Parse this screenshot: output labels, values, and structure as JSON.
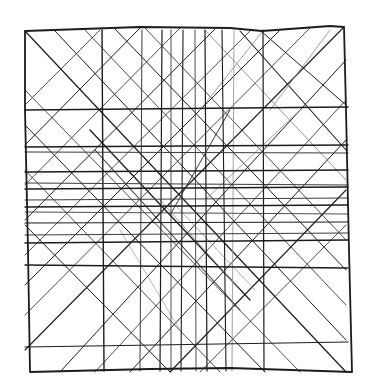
{
  "drawing": {
    "subject": "pencil sketch of a square filled with crossing horizontal, vertical and diagonal lines",
    "paper_color": "#ffffff",
    "ink_color": "#1c1c1c",
    "frame": [
      [
        25,
        31
      ],
      [
        140,
        27
      ],
      [
        230,
        28
      ],
      [
        262,
        31
      ],
      [
        330,
        26
      ],
      [
        344,
        27
      ],
      [
        346,
        110
      ],
      [
        349,
        250
      ],
      [
        352,
        372
      ],
      [
        230,
        368
      ],
      [
        150,
        369
      ],
      [
        30,
        372
      ],
      [
        28,
        250
      ],
      [
        25,
        110
      ],
      [
        25,
        31
      ]
    ],
    "horizontals": [
      {
        "y1": 110,
        "y2": 107,
        "w": 1.6,
        "tone": "dark"
      },
      {
        "y1": 147,
        "y2": 145,
        "w": 1.3,
        "tone": "dark"
      },
      {
        "y1": 152,
        "y2": 153,
        "w": 1.0,
        "tone": "mid"
      },
      {
        "y1": 172,
        "y2": 170,
        "w": 1.5,
        "tone": "dark"
      },
      {
        "y1": 183,
        "y2": 185,
        "w": 1.0,
        "tone": "mid"
      },
      {
        "y1": 189,
        "y2": 187,
        "w": 1.4,
        "tone": "dark"
      },
      {
        "y1": 200,
        "y2": 198,
        "w": 1.0,
        "tone": "mid"
      },
      {
        "y1": 207,
        "y2": 205,
        "w": 1.5,
        "tone": "dark"
      },
      {
        "y1": 212,
        "y2": 214,
        "w": 0.9,
        "tone": "mid"
      },
      {
        "y1": 223,
        "y2": 222,
        "w": 1.2,
        "tone": "dark"
      },
      {
        "y1": 235,
        "y2": 233,
        "w": 1.0,
        "tone": "mid"
      },
      {
        "y1": 243,
        "y2": 240,
        "w": 1.3,
        "tone": "dark"
      },
      {
        "y1": 265,
        "y2": 268,
        "w": 1.3,
        "tone": "dark"
      },
      {
        "y1": 347,
        "y2": 342,
        "w": 1.2,
        "tone": "dark"
      }
    ],
    "verticals": [
      {
        "x1": 102,
        "x2": 104,
        "w": 1.4,
        "tone": "dark"
      },
      {
        "x1": 142,
        "x2": 140,
        "w": 1.0,
        "tone": "mid"
      },
      {
        "x1": 162,
        "x2": 160,
        "w": 1.2,
        "tone": "dark"
      },
      {
        "x1": 171,
        "x2": 171,
        "w": 0.9,
        "tone": "mid"
      },
      {
        "x1": 183,
        "x2": 181,
        "w": 1.1,
        "tone": "dark"
      },
      {
        "x1": 195,
        "x2": 196,
        "w": 0.9,
        "tone": "mid"
      },
      {
        "x1": 205,
        "x2": 207,
        "w": 1.2,
        "tone": "dark"
      },
      {
        "x1": 222,
        "x2": 226,
        "w": 1.1,
        "tone": "dark"
      },
      {
        "x1": 234,
        "x2": 232,
        "w": 0.8,
        "tone": "light"
      },
      {
        "x1": 263,
        "x2": 264,
        "w": 1.2,
        "tone": "dark"
      }
    ],
    "diagonals": [
      {
        "x1": 25,
        "y1": 31,
        "x2": 346,
        "y2": 372,
        "w": 1.2,
        "tone": "dark"
      },
      {
        "x1": 55,
        "y1": 31,
        "x2": 346,
        "y2": 340,
        "w": 1.0,
        "tone": "dark"
      },
      {
        "x1": 85,
        "y1": 30,
        "x2": 346,
        "y2": 305,
        "w": 0.9,
        "tone": "mid"
      },
      {
        "x1": 115,
        "y1": 29,
        "x2": 346,
        "y2": 270,
        "w": 1.0,
        "tone": "dark"
      },
      {
        "x1": 145,
        "y1": 28,
        "x2": 346,
        "y2": 240,
        "w": 0.9,
        "tone": "mid"
      },
      {
        "x1": 25,
        "y1": 90,
        "x2": 300,
        "y2": 372,
        "w": 0.9,
        "tone": "mid"
      },
      {
        "x1": 25,
        "y1": 125,
        "x2": 265,
        "y2": 372,
        "w": 1.0,
        "tone": "dark"
      },
      {
        "x1": 25,
        "y1": 170,
        "x2": 220,
        "y2": 372,
        "w": 0.9,
        "tone": "mid"
      },
      {
        "x1": 25,
        "y1": 225,
        "x2": 170,
        "y2": 372,
        "w": 1.0,
        "tone": "dark"
      },
      {
        "x1": 90,
        "y1": 130,
        "x2": 250,
        "y2": 300,
        "w": 1.3,
        "tone": "dark"
      },
      {
        "x1": 95,
        "y1": 150,
        "x2": 240,
        "y2": 310,
        "w": 1.1,
        "tone": "mid"
      },
      {
        "x1": 240,
        "y1": 31,
        "x2": 346,
        "y2": 150,
        "w": 1.1,
        "tone": "dark"
      },
      {
        "x1": 205,
        "y1": 30,
        "x2": 346,
        "y2": 180,
        "w": 0.9,
        "tone": "light"
      },
      {
        "x1": 344,
        "y1": 27,
        "x2": 25,
        "y2": 350,
        "w": 1.1,
        "tone": "dark"
      },
      {
        "x1": 310,
        "y1": 28,
        "x2": 25,
        "y2": 315,
        "w": 0.9,
        "tone": "mid"
      },
      {
        "x1": 280,
        "y1": 30,
        "x2": 25,
        "y2": 285,
        "w": 1.0,
        "tone": "dark"
      },
      {
        "x1": 250,
        "y1": 31,
        "x2": 25,
        "y2": 255,
        "w": 0.9,
        "tone": "mid"
      },
      {
        "x1": 215,
        "y1": 29,
        "x2": 25,
        "y2": 220,
        "w": 1.0,
        "tone": "dark"
      },
      {
        "x1": 180,
        "y1": 28,
        "x2": 25,
        "y2": 185,
        "w": 0.9,
        "tone": "mid"
      },
      {
        "x1": 140,
        "y1": 28,
        "x2": 25,
        "y2": 145,
        "w": 1.0,
        "tone": "dark"
      },
      {
        "x1": 100,
        "y1": 30,
        "x2": 25,
        "y2": 105,
        "w": 0.9,
        "tone": "mid"
      },
      {
        "x1": 346,
        "y1": 60,
        "x2": 60,
        "y2": 372,
        "w": 1.0,
        "tone": "dark"
      },
      {
        "x1": 346,
        "y1": 100,
        "x2": 95,
        "y2": 372,
        "w": 0.9,
        "tone": "mid"
      },
      {
        "x1": 346,
        "y1": 140,
        "x2": 130,
        "y2": 372,
        "w": 1.0,
        "tone": "dark"
      },
      {
        "x1": 346,
        "y1": 190,
        "x2": 170,
        "y2": 372,
        "w": 1.1,
        "tone": "dark"
      },
      {
        "x1": 346,
        "y1": 225,
        "x2": 200,
        "y2": 372,
        "w": 0.9,
        "tone": "mid"
      },
      {
        "x1": 330,
        "y1": 30,
        "x2": 270,
        "y2": 110,
        "w": 0.8,
        "tone": "light"
      },
      {
        "x1": 300,
        "y1": 110,
        "x2": 205,
        "y2": 200,
        "w": 0.8,
        "tone": "light"
      },
      {
        "x1": 230,
        "y1": 110,
        "x2": 170,
        "y2": 215,
        "w": 1.0,
        "tone": "mid"
      },
      {
        "x1": 262,
        "y1": 32,
        "x2": 346,
        "y2": 105,
        "w": 1.0,
        "tone": "dark"
      },
      {
        "x1": 262,
        "y1": 32,
        "x2": 200,
        "y2": 110,
        "w": 0.8,
        "tone": "light"
      },
      {
        "x1": 160,
        "y1": 200,
        "x2": 240,
        "y2": 290,
        "w": 0.8,
        "tone": "light"
      },
      {
        "x1": 175,
        "y1": 205,
        "x2": 255,
        "y2": 290,
        "w": 0.7,
        "tone": "light"
      },
      {
        "x1": 120,
        "y1": 230,
        "x2": 180,
        "y2": 330,
        "w": 0.6,
        "tone": "light"
      }
    ]
  }
}
